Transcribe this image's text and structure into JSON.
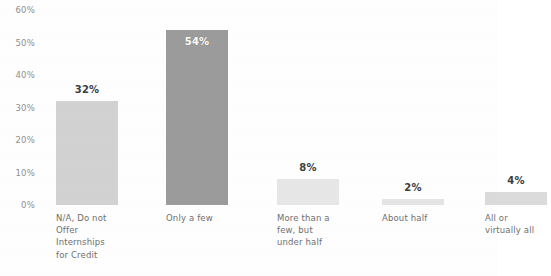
{
  "chart_data": {
    "type": "bar",
    "title": "",
    "subtitle": "",
    "xlabel": "",
    "ylabel": "",
    "ylim": [
      0,
      60
    ],
    "grid": false,
    "legend": null,
    "y_ticks": [
      "60%",
      "50%",
      "40%",
      "30%",
      "20%",
      "10%",
      "0%"
    ],
    "y_tick_values": [
      60,
      50,
      40,
      30,
      20,
      10,
      0
    ],
    "categories": [
      "N/A, Do not\nOffer\nInternships\nfor Credit",
      "Only a few",
      "More than a\nfew, but\nunder half",
      "About half",
      "All or\nvirtually all"
    ],
    "values": [
      32,
      54,
      8,
      2,
      4
    ],
    "data_labels": [
      "32%",
      "54%",
      "8%",
      "2%",
      "4%"
    ],
    "label_positions": [
      "outside",
      "inside",
      "outside",
      "outside",
      "outside"
    ],
    "bar_colors": [
      "#cfcfcf",
      "#8c8c8c",
      "#e8e8e8",
      "#e4e4e4",
      "#d9d9d9"
    ],
    "label_colors": [
      "#3d3d3d",
      "#ffffff",
      "#3d3d3d",
      "#3d3d3d",
      "#3d3d3d"
    ]
  },
  "axis": {
    "tick_color": "#8e8e8e",
    "category_label_color": "#6f6f6f"
  }
}
